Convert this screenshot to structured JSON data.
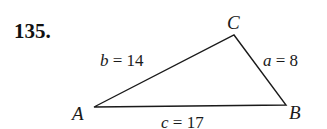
{
  "problem": {
    "number": "135."
  },
  "triangle": {
    "vertices": [
      {
        "name": "A",
        "x": 94,
        "y": 107
      },
      {
        "name": "B",
        "x": 286,
        "y": 105
      },
      {
        "name": "C",
        "x": 234,
        "y": 35
      }
    ],
    "sides": [
      {
        "var": "a",
        "value": "8",
        "text": "a = 8"
      },
      {
        "var": "b",
        "value": "14",
        "text": "b = 14"
      },
      {
        "var": "c",
        "value": "17",
        "text": "c = 17"
      }
    ]
  },
  "labels": {
    "A": "A",
    "B": "B",
    "C": "C",
    "a_var": "a",
    "a_eq": " = 8",
    "b_var": "b",
    "b_eq": " = 14",
    "c_var": "c",
    "c_eq": " = 17"
  },
  "colors": {
    "line": "#1a1a1a",
    "text": "#1a1a1a"
  }
}
